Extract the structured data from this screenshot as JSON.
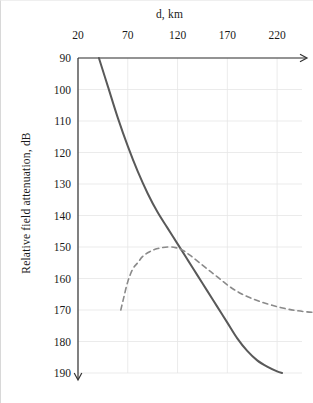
{
  "chart_data": {
    "type": "line",
    "title": "",
    "xlabel": "d, km",
    "ylabel": "Relative field attenuation, dB",
    "xlim": [
      20,
      245
    ],
    "ylim": [
      90,
      190
    ],
    "y_inverted": true,
    "grid": true,
    "legend": "none",
    "x_ticks": [
      20,
      70,
      120,
      170,
      220
    ],
    "x_tick_labels": [
      "20",
      "70",
      "120",
      "170",
      "220"
    ],
    "y_ticks": [
      90,
      100,
      110,
      120,
      130,
      140,
      150,
      160,
      170,
      180,
      190
    ],
    "y_tick_labels": [
      "90",
      "100",
      "110",
      "120",
      "130",
      "140",
      "150",
      "160",
      "170",
      "180",
      "190"
    ],
    "x_axis_position": "top",
    "x_axis_arrow": "right",
    "y_axis_arrow": "down",
    "series": [
      {
        "name": "solid-curve",
        "style": "solid",
        "color": "#595959",
        "width": 2.0,
        "points": [
          [
            41,
            90
          ],
          [
            50,
            99
          ],
          [
            60,
            109
          ],
          [
            70,
            118
          ],
          [
            80,
            126
          ],
          [
            90,
            133
          ],
          [
            100,
            139
          ],
          [
            110,
            144
          ],
          [
            120,
            149
          ],
          [
            130,
            154
          ],
          [
            140,
            159
          ],
          [
            150,
            164
          ],
          [
            160,
            169
          ],
          [
            170,
            174
          ],
          [
            180,
            179
          ],
          [
            190,
            183
          ],
          [
            200,
            186
          ],
          [
            210,
            188
          ],
          [
            220,
            189.5
          ],
          [
            225,
            190
          ]
        ]
      },
      {
        "name": "dashed-curve",
        "style": "dashed",
        "color": "#8a8a8a",
        "width": 1.6,
        "dash": "5,4",
        "points": [
          [
            63,
            170
          ],
          [
            66,
            166
          ],
          [
            70,
            161
          ],
          [
            75,
            157
          ],
          [
            80,
            155
          ],
          [
            85,
            153
          ],
          [
            92,
            151.5
          ],
          [
            100,
            150.5
          ],
          [
            110,
            150
          ],
          [
            118,
            150.2
          ],
          [
            125,
            151
          ],
          [
            132,
            152.5
          ],
          [
            140,
            154.5
          ],
          [
            150,
            157
          ],
          [
            160,
            159.5
          ],
          [
            172,
            162.5
          ],
          [
            185,
            165
          ],
          [
            200,
            167
          ],
          [
            215,
            168.5
          ],
          [
            232,
            169.8
          ],
          [
            250,
            170.6
          ],
          [
            270,
            171
          ]
        ]
      }
    ]
  },
  "geometry": {
    "plot_left": 77,
    "plot_right": 301,
    "plot_top": 57,
    "plot_bottom": 372
  }
}
